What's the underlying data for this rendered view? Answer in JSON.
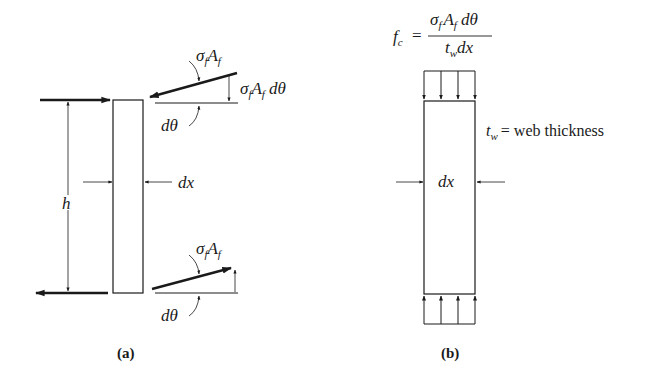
{
  "panel_a": {
    "caption": "(a)",
    "height_label": "h",
    "width_label": "dx",
    "top_force_label_sigma": "σ",
    "top_force_label_sub_f": "f",
    "top_force_label_A": "A",
    "top_force_label_sub_f2": "f",
    "top_component_label_sigma": "σ",
    "top_component_label_sub_f": "f",
    "top_component_label_A": "A",
    "top_component_label_sub_f2": "f",
    "top_component_label_dtheta": "dθ",
    "top_angle_label": "dθ",
    "bottom_force_label_sigma": "σ",
    "bottom_force_label_sub_f": "f",
    "bottom_force_label_A": "A",
    "bottom_force_label_sub_f2": "f",
    "bottom_angle_label": "dθ"
  },
  "panel_b": {
    "caption": "(b)",
    "formula_lhs": "f",
    "formula_lhs_sub": "c",
    "formula_equals": "=",
    "formula_num_sigma": "σ",
    "formula_num_sub_f": "f",
    "formula_num_A": "A",
    "formula_num_sub_f2": "f",
    "formula_num_dtheta": "dθ",
    "formula_den_t": "t",
    "formula_den_sub_w": "w",
    "formula_den_dx": "dx",
    "width_label": "dx",
    "thickness_symbol": "t",
    "thickness_sub": "w",
    "thickness_text": "= web thickness"
  },
  "colors": {
    "ink": "#1a1a1a",
    "background": "#ffffff"
  }
}
